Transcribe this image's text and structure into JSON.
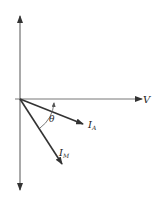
{
  "diagram": {
    "type": "phasor-diagram",
    "axes": {
      "horizontal_label": "V",
      "vertical_label": ""
    },
    "vectors": [
      {
        "name": "I_A",
        "label_main": "I",
        "label_sub": "A"
      },
      {
        "name": "I_M",
        "label_main": "I",
        "label_sub": "M"
      }
    ],
    "angle": {
      "label": "θ",
      "between": [
        "V",
        "I_M"
      ]
    },
    "colors": {
      "line": "#333333",
      "text": "#222222",
      "background": "#ffffff"
    }
  }
}
